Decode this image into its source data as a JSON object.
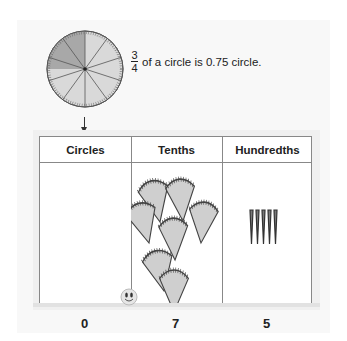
{
  "caption": {
    "numerator": "3",
    "denominator": "4",
    "text": "of a circle is 0.75 circle."
  },
  "circle": {
    "sectors": 10,
    "shaded_fraction": 0.25,
    "shade_color": "#a8a8a8",
    "base_color": "#d9d9d9",
    "outline_color": "#555555"
  },
  "table": {
    "headers": [
      "Circles",
      "Tenths",
      "Hundredths"
    ],
    "values": [
      "0",
      "7",
      "5"
    ],
    "tenths_pieces": 7,
    "hundredths_pieces": 5
  },
  "colors": {
    "panel": "#f8f8f8",
    "table_border": "#888888",
    "text": "#222222"
  }
}
